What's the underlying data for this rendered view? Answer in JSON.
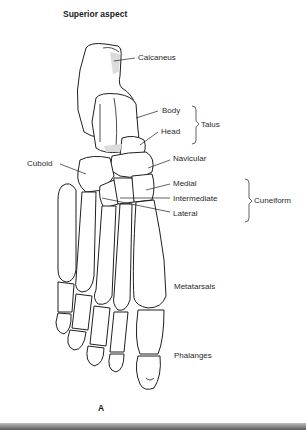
{
  "figure": {
    "title": "Superior aspect",
    "panel_letter": "A"
  },
  "labels": {
    "calcaneus": "Calcaneus",
    "body": "Body",
    "head": "Head",
    "talus": "Talus",
    "navicular": "Navicular",
    "cuboid": "Cuboid",
    "medial": "Medial",
    "intermediate": "Intermediate",
    "lateral": "Lateral",
    "cuneiform": "Cuneiform",
    "metatarsals": "Metatarsals",
    "phalanges": "Phalanges"
  },
  "colors": {
    "background": "#ffffff",
    "outline": "#1f1f1f",
    "shading": "#dcdcdc"
  }
}
